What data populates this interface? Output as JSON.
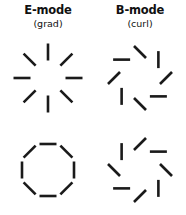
{
  "figure": {
    "background_color": "#ffffff",
    "tick_color": "#1a1a1a",
    "width": 186,
    "height": 215
  },
  "columns": [
    {
      "key": "e_mode",
      "title": "E-mode",
      "subtitle": "(grad)"
    },
    {
      "key": "b_mode",
      "title": "B-mode",
      "subtitle": "(curl)"
    }
  ],
  "chart_data": {
    "type": "scatter",
    "xlabel": "",
    "ylabel": "",
    "legend_entries": [
      "E-mode (grad)",
      "B-mode (curl)"
    ],
    "panels": [
      {
        "name": "e-mode-radial",
        "column": "E-mode",
        "row": 0,
        "description": "radial ticks pointing outward from centre",
        "tick_count": 8,
        "center": [
          46,
          42
        ],
        "ring_radius": 26,
        "tick_length": 17,
        "offset_deg": 0,
        "position_angles_deg": [
          0,
          45,
          90,
          135,
          180,
          225,
          270,
          315
        ],
        "tick_angles_deg": [
          0,
          45,
          90,
          135,
          180,
          225,
          270,
          315
        ]
      },
      {
        "name": "b-mode-plus45",
        "column": "B-mode",
        "row": 0,
        "description": "ticks rotated +45 degrees from radial",
        "tick_count": 8,
        "center": [
          46,
          42
        ],
        "ring_radius": 26,
        "tick_length": 17,
        "offset_deg": 45,
        "position_angles_deg": [
          0,
          45,
          90,
          135,
          180,
          225,
          270,
          315
        ],
        "tick_angles_deg": [
          45,
          90,
          135,
          180,
          225,
          270,
          315,
          360
        ]
      },
      {
        "name": "e-mode-tangential",
        "column": "E-mode",
        "row": 1,
        "description": "tangential ticks perpendicular to radius forming an octagon",
        "tick_count": 8,
        "center": [
          46,
          42
        ],
        "ring_radius": 26,
        "tick_length": 17,
        "offset_deg": 90,
        "position_angles_deg": [
          0,
          45,
          90,
          135,
          180,
          225,
          270,
          315
        ],
        "tick_angles_deg": [
          90,
          135,
          180,
          225,
          270,
          315,
          360,
          405
        ]
      },
      {
        "name": "b-mode-minus45",
        "column": "B-mode",
        "row": 1,
        "description": "ticks rotated -45 degrees from radial",
        "tick_count": 8,
        "center": [
          46,
          42
        ],
        "ring_radius": 26,
        "tick_length": 17,
        "offset_deg": -45,
        "position_angles_deg": [
          0,
          45,
          90,
          135,
          180,
          225,
          270,
          315
        ],
        "tick_angles_deg": [
          -45,
          0,
          45,
          90,
          135,
          180,
          225,
          270
        ]
      }
    ]
  }
}
